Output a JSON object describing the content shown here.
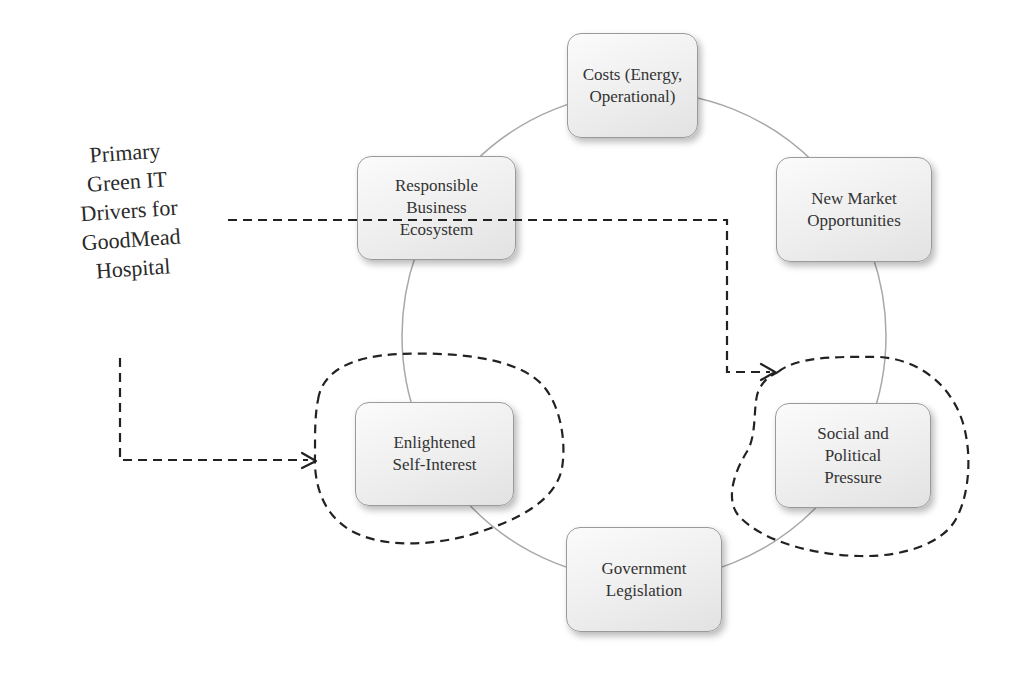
{
  "diagram": {
    "title_lines": [
      "Primary",
      "Green IT",
      "Drivers for",
      "GoodMead",
      "Hospital"
    ],
    "cycle": {
      "center": [
        644,
        336
      ],
      "radius_x": 242,
      "radius_y": 244,
      "stroke_color": "#a8a8a8"
    },
    "nodes": [
      {
        "id": "costs",
        "label": "Costs (Energy,\nOperational)",
        "x": 567,
        "y": 33,
        "w": 131,
        "h": 105,
        "highlighted": false
      },
      {
        "id": "new-market",
        "label": "New Market\nOpportunities",
        "x": 776,
        "y": 157,
        "w": 156,
        "h": 105,
        "highlighted": false
      },
      {
        "id": "social-political",
        "label": "Social and\nPolitical\nPressure",
        "x": 775,
        "y": 403,
        "w": 156,
        "h": 105,
        "highlighted": true
      },
      {
        "id": "government",
        "label": "Government\nLegislation",
        "x": 566,
        "y": 527,
        "w": 156,
        "h": 105,
        "highlighted": false
      },
      {
        "id": "enlightened",
        "label": "Enlightened\nSelf-Interest",
        "x": 355,
        "y": 402,
        "w": 159,
        "h": 104,
        "highlighted": true
      },
      {
        "id": "responsible",
        "label": "Responsible\nBusiness\nEcosystem",
        "x": 357,
        "y": 156,
        "w": 159,
        "h": 104,
        "highlighted": false
      }
    ],
    "arrows": [
      {
        "from": "title",
        "to": "social-political",
        "style": "dashed"
      },
      {
        "from": "title",
        "to": "enlightened",
        "style": "dashed"
      }
    ],
    "dash_color": "#222222",
    "node_border_color": "#9a9a9a"
  }
}
